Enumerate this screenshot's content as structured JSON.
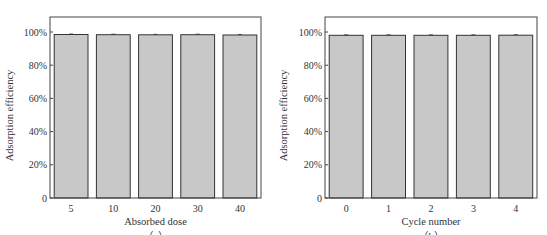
{
  "chart_data": [
    {
      "type": "bar",
      "panel_label": "（a）",
      "title": "",
      "xlabel": "Absorbed dose",
      "ylabel": "Adsorption efficiency",
      "categories": [
        "5",
        "10",
        "20",
        "30",
        "40"
      ],
      "values": [
        98.5,
        98.4,
        98.3,
        98.4,
        98.2
      ],
      "ylim": [
        0,
        110
      ],
      "yticks": [
        0,
        20,
        40,
        60,
        80,
        100
      ],
      "ytick_labels": [
        "0",
        "20%",
        "40%",
        "60%",
        "80%",
        "100%"
      ],
      "grid": false,
      "legend": "none",
      "bar_color": "#c8c8c8",
      "edge_color": "#333333"
    },
    {
      "type": "bar",
      "panel_label": "（b）",
      "title": "",
      "xlabel": "Cycle number",
      "ylabel": "Adsorption efficiency",
      "categories": [
        "0",
        "1",
        "2",
        "3",
        "4"
      ],
      "values": [
        98.0,
        98.0,
        98.0,
        98.0,
        98.1
      ],
      "ylim": [
        0,
        110
      ],
      "yticks": [
        0,
        20,
        40,
        60,
        80,
        100
      ],
      "ytick_labels": [
        "0",
        "20%",
        "40%",
        "60%",
        "80%",
        "100%"
      ],
      "grid": false,
      "legend": "none",
      "bar_color": "#c8c8c8",
      "edge_color": "#333333"
    }
  ]
}
